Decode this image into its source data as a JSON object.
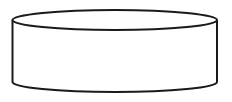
{
  "diagram": {
    "shape": "cylinder",
    "stroke_color": "#1a1a1a",
    "fill_color": "#ffffff",
    "stroke_width": 2,
    "geometry": {
      "left_x": 12.5,
      "right_x": 217,
      "top_center_y": 20,
      "bottom_center_y": 82,
      "ellipse_ry": 10
    }
  }
}
